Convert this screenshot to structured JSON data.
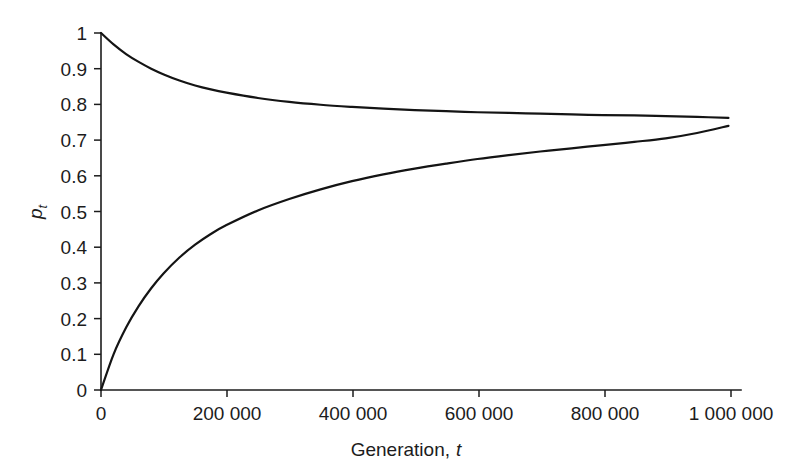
{
  "figure": {
    "background_color": "#ffffff",
    "ink_color": "#1c1c1c",
    "curve_color": "#141414"
  },
  "chart_data": {
    "type": "line",
    "title": "",
    "subtitle": "",
    "xlabel_text": "Generation,",
    "xlabel_symbol": "t",
    "ylabel_symbol": "p",
    "ylabel_subscript": "t",
    "xlim": [
      0,
      1020000
    ],
    "ylim": [
      0,
      1
    ],
    "grid": false,
    "legend": false,
    "legend_position": "none",
    "frame": "left-bottom",
    "xticks": [
      0,
      200000,
      400000,
      600000,
      800000,
      1000000
    ],
    "xticklabels": [
      "0",
      "200 000",
      "400 000",
      "600 000",
      "800 000",
      "1 000 000"
    ],
    "yticks": [
      0,
      0.1,
      0.2,
      0.3,
      0.4,
      0.5,
      0.6,
      0.7,
      0.8,
      0.9,
      1
    ],
    "yticklabels": [
      "0",
      "0.1",
      "0.2",
      "0.3",
      "0.4",
      "0.5",
      "0.6",
      "0.7",
      "0.8",
      "0.9",
      "1"
    ],
    "x": [
      0,
      20000,
      40000,
      60000,
      80000,
      100000,
      125000,
      150000,
      175000,
      200000,
      250000,
      300000,
      350000,
      400000,
      450000,
      500000,
      550000,
      600000,
      650000,
      700000,
      750000,
      800000,
      850000,
      900000,
      950000,
      1000000
    ],
    "series": [
      {
        "name": "upper-curve",
        "start_value": 1.0,
        "end_value": 0.762,
        "asymptote": 0.75,
        "values": [
          1.0,
          0.968,
          0.941,
          0.919,
          0.9,
          0.884,
          0.867,
          0.853,
          0.842,
          0.833,
          0.818,
          0.807,
          0.799,
          0.793,
          0.788,
          0.784,
          0.781,
          0.778,
          0.776,
          0.774,
          0.772,
          0.77,
          0.769,
          0.767,
          0.765,
          0.762
        ]
      },
      {
        "name": "lower-curve",
        "start_value": 0.0,
        "end_value": 0.74,
        "asymptote": 0.75,
        "values": [
          0.0,
          0.1,
          0.175,
          0.235,
          0.285,
          0.327,
          0.371,
          0.407,
          0.437,
          0.462,
          0.503,
          0.535,
          0.562,
          0.585,
          0.604,
          0.62,
          0.634,
          0.647,
          0.658,
          0.668,
          0.677,
          0.686,
          0.695,
          0.705,
          0.72,
          0.74
        ]
      }
    ],
    "annotations": []
  }
}
